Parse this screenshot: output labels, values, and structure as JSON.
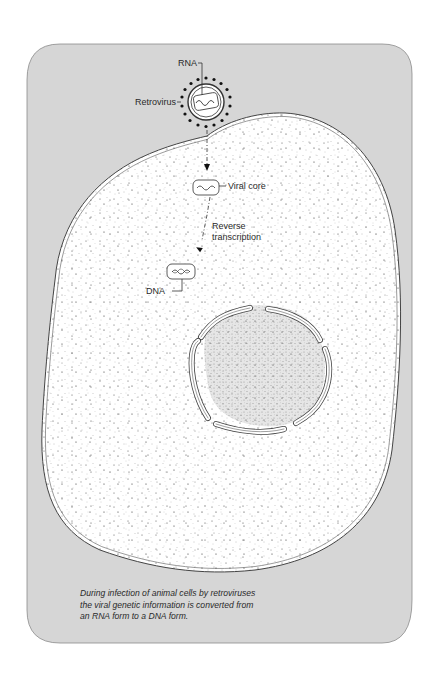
{
  "figure": {
    "panel_color": "#d6d6d6",
    "cytoplasm_color": "#ffffff",
    "nucleus_color": "#e4e4e4",
    "outline_color": "#444444",
    "labels": {
      "rna": "RNA",
      "retrovirus": "Retrovirus",
      "viral_core": "Viral core",
      "reverse_line1": "Reverse",
      "reverse_line2": "transcription",
      "dna": "DNA"
    },
    "caption": {
      "line1": "During infection of animal cells by retroviruses",
      "line2": "the viral genetic information is converted from",
      "line3": "an RNA form to a DNA form."
    }
  }
}
